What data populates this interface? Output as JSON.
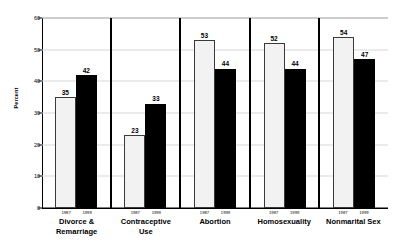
{
  "chart_data": {
    "type": "bar",
    "title": "",
    "xlabel": "",
    "ylabel": "Percent",
    "ylim": [
      0,
      60
    ],
    "yticks": [
      0,
      10,
      20,
      30,
      40,
      50,
      60
    ],
    "grid": true,
    "legend_position": "none",
    "categories": [
      "Divorce & Remarriage",
      "Contraceptive Use",
      "Abortion",
      "Homosexuality",
      "Nonmarital Sex"
    ],
    "series": [
      {
        "name": "1987",
        "values": [
          35,
          23,
          53,
          52,
          54
        ]
      },
      {
        "name": "1999",
        "values": [
          42,
          33,
          44,
          44,
          47
        ]
      }
    ]
  },
  "axis": {
    "y_title": "Percent",
    "ticks": [
      {
        "label": "60",
        "value": 60
      },
      {
        "label": "50",
        "value": 50
      },
      {
        "label": "40",
        "value": 40
      },
      {
        "label": "30",
        "value": 30
      },
      {
        "label": "20",
        "value": 20
      },
      {
        "label": "10",
        "value": 10
      },
      {
        "label": "0",
        "value": 0
      }
    ]
  },
  "panels": [
    {
      "category_line1": "Divorce &",
      "category_line2": "Remarriage",
      "bars": [
        {
          "year": "1987",
          "value": 35,
          "label": "35",
          "style": "light"
        },
        {
          "year": "1999",
          "value": 42,
          "label": "42",
          "style": "dark"
        }
      ]
    },
    {
      "category_line1": "Contraceptive",
      "category_line2": "Use",
      "bars": [
        {
          "year": "1987",
          "value": 23,
          "label": "23",
          "style": "light"
        },
        {
          "year": "1999",
          "value": 33,
          "label": "33",
          "style": "dark"
        }
      ]
    },
    {
      "category_line1": "Abortion",
      "category_line2": "",
      "bars": [
        {
          "year": "1987",
          "value": 53,
          "label": "53",
          "style": "light"
        },
        {
          "year": "1999",
          "value": 44,
          "label": "44",
          "style": "dark"
        }
      ]
    },
    {
      "category_line1": "Homosexuality",
      "category_line2": "",
      "bars": [
        {
          "year": "1987",
          "value": 52,
          "label": "52",
          "style": "light"
        },
        {
          "year": "1999",
          "value": 44,
          "label": "44",
          "style": "dark"
        }
      ]
    },
    {
      "category_line1": "Nonmarital Sex",
      "category_line2": "",
      "bars": [
        {
          "year": "1987",
          "value": 54,
          "label": "54",
          "style": "light"
        },
        {
          "year": "1999",
          "value": 47,
          "label": "47",
          "style": "dark"
        }
      ]
    }
  ],
  "colors": {
    "bar_1987": "#f2f2f2",
    "bar_1999": "#000000",
    "bar_outline": "#3a3a3a",
    "gridline": "#d8d8d8",
    "axis": "#000000",
    "background": "#ffffff"
  }
}
